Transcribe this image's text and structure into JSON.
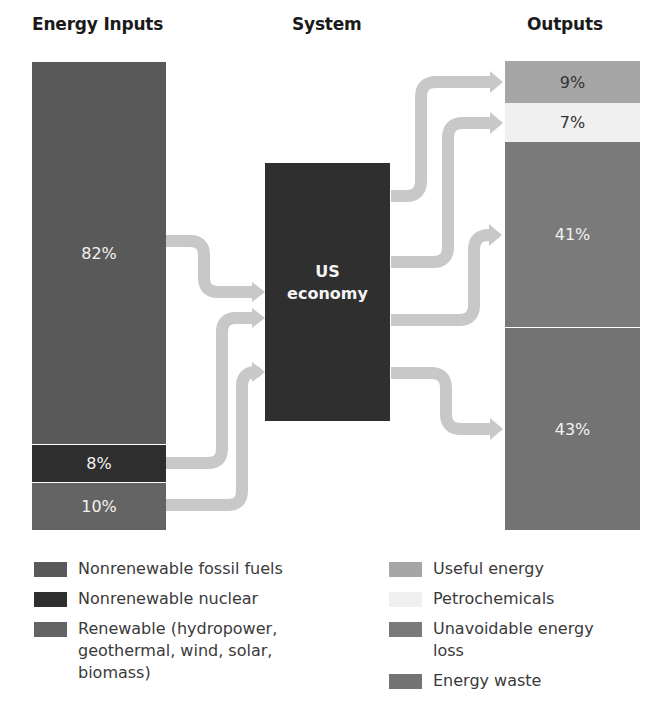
{
  "headers": {
    "inputs": "Energy Inputs",
    "system": "System",
    "outputs": "Outputs"
  },
  "system": {
    "line1": "US",
    "line2": "economy",
    "color": "#2f2f2f"
  },
  "inputs": [
    {
      "label": "82%",
      "value": 82,
      "category": "Nonrenewable fossil fuels",
      "color": "#595959"
    },
    {
      "label": "8%",
      "value": 8,
      "category": "Nonrenewable nuclear",
      "color": "#2e2e2e"
    },
    {
      "label": "10%",
      "value": 10,
      "category": "Renewable (hydropower, geothermal, wind, solar, biomass)",
      "color": "#646464"
    }
  ],
  "outputs": [
    {
      "label": "9%",
      "value": 9,
      "category": "Useful energy",
      "color": "#a6a6a6"
    },
    {
      "label": "7%",
      "value": 7,
      "category": "Petrochemicals",
      "color": "#f0f0f0"
    },
    {
      "label": "41%",
      "value": 41,
      "category": "Unavoidable energy loss",
      "color": "#7a7a7a"
    },
    {
      "label": "43%",
      "value": 43,
      "category": "Energy waste",
      "color": "#737373"
    }
  ],
  "legend_left": [
    {
      "text": "Nonrenewable fossil fuels",
      "color": "#595959"
    },
    {
      "text": "Nonrenewable nuclear",
      "color": "#2e2e2e"
    },
    {
      "text": "Renewable (hydropower, geothermal, wind, solar, biomass)",
      "color": "#646464"
    }
  ],
  "legend_right": [
    {
      "text": "Useful energy",
      "color": "#a6a6a6"
    },
    {
      "text": "Petrochemicals",
      "color": "#f0f0f0"
    },
    {
      "text": "Unavoidable energy loss",
      "color": "#7a7a7a"
    },
    {
      "text": "Energy waste",
      "color": "#737373"
    }
  ],
  "arrow_color": "#c8c8c8"
}
